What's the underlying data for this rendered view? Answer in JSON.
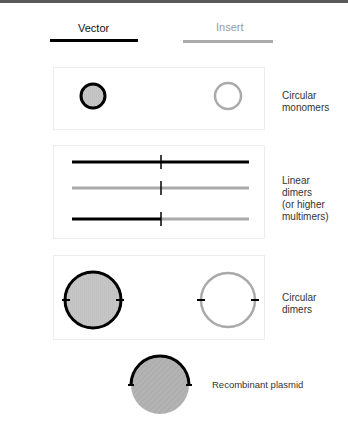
{
  "legend": {
    "vector": {
      "label": "Vector",
      "color": "#000000"
    },
    "insert": {
      "label": "Insert",
      "color": "#aaaaaa"
    }
  },
  "panels": [
    {
      "id": "circular-monomers",
      "label_lines": [
        "Circular",
        "monomers"
      ]
    },
    {
      "id": "linear-dimers",
      "label_lines": [
        "Linear",
        "dimers",
        "(or higher",
        "multimers)"
      ]
    },
    {
      "id": "circular-dimers",
      "label_lines": [
        "Circular",
        "dimers"
      ]
    }
  ],
  "recombinant": {
    "label": "Recombinant plasmid"
  },
  "colors": {
    "vector": "#000000",
    "insert": "#aaaaaa",
    "fill": "#c4c4c4",
    "recombinant_fill": "#b0b0b0",
    "box_border": "#ededed"
  }
}
